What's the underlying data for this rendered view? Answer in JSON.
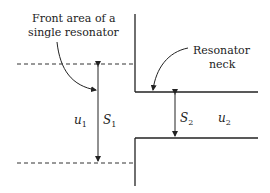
{
  "diagram": {
    "labels": {
      "front_area_line1": "Front area of a",
      "front_area_line2": "single resonator",
      "neck_line1": "Resonator",
      "neck_line2": "neck"
    },
    "symbols": {
      "u1": {
        "base": "u",
        "sub": "1"
      },
      "S1": {
        "base": "S",
        "sub": "1"
      },
      "S2": {
        "base": "S",
        "sub": "2"
      },
      "u2": {
        "base": "u",
        "sub": "2"
      }
    },
    "colors": {
      "line": "#222222",
      "dashed": "#333333",
      "background": "#ffffff"
    }
  }
}
